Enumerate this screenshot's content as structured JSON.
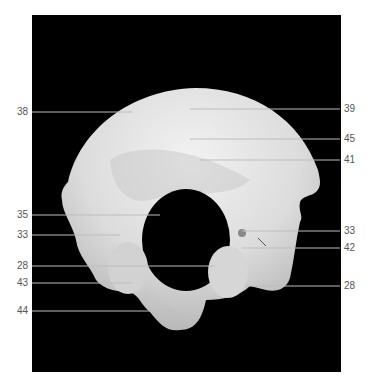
{
  "figure": {
    "background_color": "#000000",
    "bone_color": "#e6e6e6",
    "label_color": "#555555",
    "line_color": "#bbbbbb"
  },
  "labels_left": [
    {
      "id": "l38",
      "text": "38"
    },
    {
      "id": "l35",
      "text": "35"
    },
    {
      "id": "l33a",
      "text": "33"
    },
    {
      "id": "l28a",
      "text": "28"
    },
    {
      "id": "l43",
      "text": "43"
    },
    {
      "id": "l44",
      "text": "44"
    }
  ],
  "labels_right": [
    {
      "id": "r39",
      "text": "39"
    },
    {
      "id": "r45",
      "text": "45"
    },
    {
      "id": "r41",
      "text": "41"
    },
    {
      "id": "r33",
      "text": "33"
    },
    {
      "id": "r42",
      "text": "42"
    },
    {
      "id": "r28",
      "text": "28"
    }
  ]
}
